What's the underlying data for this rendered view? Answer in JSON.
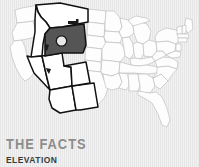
{
  "panel": {
    "background_color": "#ededed",
    "texture": "vertical-stripes"
  },
  "map": {
    "title": "united-states-map",
    "region_focus": "Mountain West",
    "highlighted_state": "Wyoming",
    "highlighted_state_fill": "#555555",
    "outlined_states_fill": "#ffffff",
    "outlined_states_stroke": "#111111",
    "base_states_stroke": "#b9b9b9",
    "base_states_fill": "#fdfdfd",
    "marker": {
      "name": "location-marker",
      "fill": "#e8e8e8",
      "stroke": "#1a1a1a"
    },
    "montana_bar": {
      "name": "montana-bar-mark",
      "fill": "#1a1a1a"
    },
    "outlined_states": [
      "Montana",
      "Idaho",
      "Wyoming",
      "Nevada",
      "Utah",
      "Colorado",
      "Arizona",
      "New Mexico"
    ]
  },
  "facts": {
    "title": "THE FACTS",
    "title_color": "#8d8d8d",
    "subtitle": "ELEVATION",
    "subtitle_color": "#3a3a3a"
  }
}
